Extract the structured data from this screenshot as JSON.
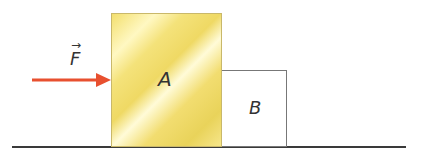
{
  "diagram": {
    "force_label": "F",
    "force_vector_mark": "→",
    "block_a_label": "A",
    "block_b_label": "B",
    "colors": {
      "force_arrow": "#e8502f",
      "block_a_fill": "#f3df6e",
      "block_b_fill": "#ffffff",
      "ground": "#3a3a3a"
    }
  }
}
